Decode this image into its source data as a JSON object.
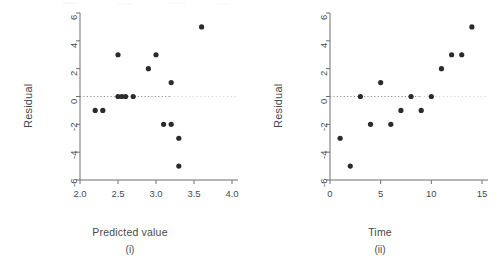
{
  "figure": {
    "background": "#ffffff",
    "ink_color": "#3c3c3c",
    "axis_color": "#6e6e6e",
    "marker_color": "#2b2b2b",
    "zeroline_color": "#8a8a8a"
  },
  "chart_data": [
    {
      "type": "scatter",
      "title": "",
      "panel_label": "(i)",
      "xlabel": "Predicted value",
      "ylabel": "Residual",
      "xlim": [
        2.0,
        4.0
      ],
      "ylim": [
        -6,
        6
      ],
      "xticks": [
        2.0,
        2.5,
        3.0,
        3.5,
        4.0
      ],
      "xticklabels": [
        "2.0",
        "2.5",
        "3.0",
        "3.5",
        "4.0"
      ],
      "yticks": [
        6,
        4,
        2,
        0,
        -2,
        -4,
        -6
      ],
      "yticklabels": [
        "6",
        "4",
        "2",
        "0",
        "-2",
        "-4",
        "-6"
      ],
      "grid": false,
      "legend": null,
      "reference_lines": [
        {
          "orientation": "horizontal",
          "value": 0,
          "style": "dotted"
        }
      ],
      "x": [
        2.2,
        2.3,
        2.5,
        2.5,
        2.55,
        2.6,
        2.7,
        2.9,
        3.0,
        3.1,
        3.2,
        3.2,
        3.3,
        3.3,
        3.6
      ],
      "y": [
        -1,
        -1,
        3,
        0,
        0,
        0,
        0,
        2,
        3,
        -2,
        1,
        -2,
        -3,
        -5,
        5
      ]
    },
    {
      "type": "scatter",
      "title": "",
      "panel_label": "(ii)",
      "xlabel": "Time",
      "ylabel": "Residual",
      "xlim": [
        0,
        15
      ],
      "ylim": [
        -6,
        6
      ],
      "xticks": [
        0,
        5,
        10,
        15
      ],
      "xticklabels": [
        "0",
        "5",
        "10",
        "15"
      ],
      "yticks": [
        6,
        4,
        2,
        0,
        -2,
        -4,
        -6
      ],
      "yticklabels": [
        "6",
        "4",
        "2",
        "0",
        "-2",
        "-4",
        "-6"
      ],
      "grid": false,
      "legend": null,
      "reference_lines": [
        {
          "orientation": "horizontal",
          "value": 0,
          "style": "dotted"
        }
      ],
      "x": [
        1,
        2,
        3,
        4,
        5,
        6,
        7,
        8,
        9,
        10,
        11,
        12,
        13,
        14
      ],
      "y": [
        -3,
        -5,
        0,
        -2,
        1,
        -2,
        -1,
        0,
        -1,
        0,
        2,
        3,
        3,
        5
      ]
    }
  ]
}
